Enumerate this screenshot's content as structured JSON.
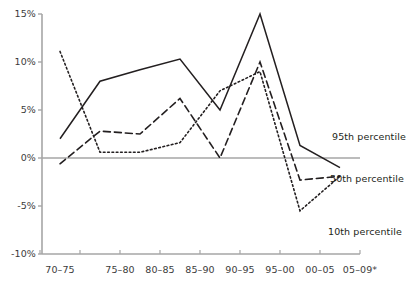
{
  "chart_data": {
    "type": "line",
    "title": "",
    "xlabel": "",
    "ylabel": "",
    "categories": [
      "70–75",
      "75–80",
      "80–85",
      "85–90",
      "90–95",
      "95–00",
      "00–05",
      "05–09*"
    ],
    "ylim": [
      -10,
      15
    ],
    "ytick_labels": [
      "15%",
      "10%",
      "5%",
      "0%",
      "-10%",
      "-5%"
    ],
    "yticks": [
      15,
      10,
      5,
      0,
      -5,
      -10
    ],
    "ytick_text": [
      "15%",
      "10%",
      "5%",
      "0%",
      "-5%",
      "-10%"
    ],
    "grid": false,
    "legend_position": "inline-right",
    "series": [
      {
        "name": "95th percentile",
        "style": "solid",
        "values": [
          2.0,
          8.0,
          9.2,
          10.3,
          5.0,
          15.0,
          1.3,
          -1.0
        ]
      },
      {
        "name": "50th percentile",
        "style": "dashed",
        "values": [
          -0.6,
          2.8,
          2.5,
          6.2,
          0.0,
          10.0,
          -2.3,
          -1.9
        ]
      },
      {
        "name": "10th percentile",
        "style": "dotted",
        "values": [
          11.1,
          0.6,
          0.6,
          1.6,
          7.0,
          9.0,
          -5.5,
          -1.9
        ]
      }
    ]
  },
  "annotations": [
    {
      "label": "95th percentile",
      "x": 332,
      "y": 131
    },
    {
      "label": "50th percentile",
      "x": 330,
      "y": 173
    },
    {
      "label": "10th percentile",
      "x": 328,
      "y": 226
    }
  ],
  "colors": {
    "axis": "#a6a6a6",
    "line": "#231f20",
    "tick_text": "#3b3b3b",
    "background": "#ffffff"
  }
}
